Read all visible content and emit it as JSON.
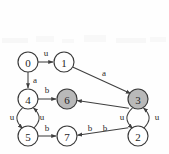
{
  "diagram": {
    "background_color": "#fefefe",
    "node_stroke_color": "#3a3a3a",
    "node_fill_plain": "#ffffff",
    "node_fill_shaded": "#b9b9b9",
    "edge_color": "#3f3f3f",
    "text_color": "#262626",
    "nodes": [
      {
        "id": "0",
        "label": "0",
        "x": 28,
        "y": 62,
        "r": 10,
        "shaded": false
      },
      {
        "id": "1",
        "label": "1",
        "x": 64,
        "y": 62,
        "r": 10,
        "shaded": false
      },
      {
        "id": "4",
        "label": "4",
        "x": 28,
        "y": 99,
        "r": 10,
        "shaded": false
      },
      {
        "id": "6",
        "label": "6",
        "x": 67,
        "y": 99,
        "r": 10,
        "shaded": true
      },
      {
        "id": "3",
        "label": "3",
        "x": 138,
        "y": 99,
        "r": 10,
        "shaded": true
      },
      {
        "id": "5",
        "label": "5",
        "x": 28,
        "y": 136,
        "r": 10,
        "shaded": false
      },
      {
        "id": "7",
        "label": "7",
        "x": 67,
        "y": 136,
        "r": 10,
        "shaded": false
      },
      {
        "id": "2",
        "label": "2",
        "x": 138,
        "y": 136,
        "r": 10,
        "shaded": false
      }
    ],
    "edges": [
      {
        "id": "e0-1",
        "from": "0",
        "to": "1",
        "label": "u",
        "label_x": 46,
        "label_y": 53,
        "kind": "straight"
      },
      {
        "id": "e0-4",
        "from": "0",
        "to": "4",
        "label": "a",
        "label_x": 35,
        "label_y": 80,
        "kind": "straight"
      },
      {
        "id": "e1-3",
        "from": "1",
        "to": "3",
        "label": "a",
        "label_x": 104,
        "label_y": 73,
        "kind": "straight"
      },
      {
        "id": "e4-6",
        "from": "4",
        "to": "6",
        "label": "b",
        "label_x": 47,
        "label_y": 90,
        "kind": "straight"
      },
      {
        "id": "e5-7",
        "from": "5",
        "to": "7",
        "label": "b",
        "label_x": 47,
        "label_y": 128,
        "kind": "straight"
      },
      {
        "id": "e4-5",
        "from": "4",
        "to": "5",
        "label": "u",
        "label_x": 12,
        "label_y": 117,
        "kind": "curve-left"
      },
      {
        "id": "e5-4",
        "from": "5",
        "to": "4",
        "label": "u",
        "label_x": 42,
        "label_y": 117,
        "kind": "curve-right"
      },
      {
        "id": "e3-2",
        "from": "3",
        "to": "2",
        "label": "u",
        "label_x": 122,
        "label_y": 117,
        "kind": "curve-left"
      },
      {
        "id": "e2-3",
        "from": "2",
        "to": "3",
        "label": "u",
        "label_x": 157,
        "label_y": 117,
        "kind": "curve-right"
      },
      {
        "id": "e3-6",
        "from": "3",
        "to": "6",
        "label": "b",
        "label_x": 90,
        "label_y": 128,
        "kind": "straight"
      },
      {
        "id": "e2-7",
        "from": "2",
        "to": "7",
        "label": "b",
        "label_x": 105,
        "label_y": 128,
        "kind": "straight"
      }
    ],
    "accepting_nodes": [
      "6",
      "3"
    ]
  }
}
